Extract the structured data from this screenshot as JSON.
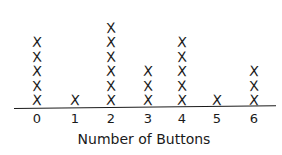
{
  "chart_data": {
    "type": "scatter",
    "subtype": "line-plot (dot plot with X marks)",
    "title": "",
    "xlabel": "Number of Buttons",
    "ylabel": "",
    "categories": [
      "0",
      "1",
      "2",
      "3",
      "4",
      "5",
      "6"
    ],
    "values": [
      5,
      1,
      6,
      3,
      5,
      1,
      3
    ],
    "marker": "X",
    "grid": false,
    "legend": null
  },
  "labels": {
    "ticks": [
      "0",
      "1",
      "2",
      "3",
      "4",
      "5",
      "6"
    ],
    "xlabel": "Number of Buttons",
    "mark": "X"
  }
}
